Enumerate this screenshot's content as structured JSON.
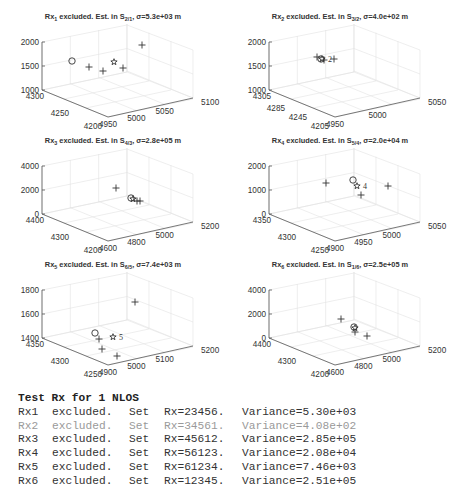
{
  "figure": {
    "panels": [
      {
        "id": "rx1",
        "title_main": "Rx",
        "title_sub": "1",
        "title_mid": " excluded. Est. in S",
        "title_sub2": "2/1",
        "title_end": ", σ=5.3e+03 m",
        "z_ticks": [
          "2000",
          "1500",
          "1000"
        ],
        "y_ticks": [
          "4300",
          "4250",
          "4200"
        ],
        "x_ticks": [
          "4950",
          "5000",
          "5050",
          "5100"
        ],
        "markers": [
          {
            "type": "circle",
            "x": 72,
            "y": 61
          },
          {
            "type": "plus",
            "x": 89,
            "y": 67
          },
          {
            "type": "plus",
            "x": 103,
            "y": 71
          },
          {
            "type": "star",
            "x": 114,
            "y": 62
          },
          {
            "type": "plus",
            "x": 123,
            "y": 68
          },
          {
            "type": "plus",
            "x": 142,
            "y": 45
          }
        ],
        "label": ""
      },
      {
        "id": "rx2",
        "title_main": "Rx",
        "title_sub": "2",
        "title_mid": " excluded. Est. in S",
        "title_sub2": "3/2",
        "title_end": ", σ=4.0e+02 m",
        "z_ticks": [
          "2000",
          "1500",
          "1000"
        ],
        "y_ticks": [
          "4305",
          "4285",
          "4245",
          "4205"
        ],
        "x_ticks": [
          "4950",
          "5000",
          "5050"
        ],
        "markers": [
          {
            "type": "plus",
            "x": 90,
            "y": 57
          },
          {
            "type": "circle",
            "x": 94,
            "y": 59
          },
          {
            "type": "star",
            "x": 95,
            "y": 59
          },
          {
            "type": "plus",
            "x": 97,
            "y": 60
          },
          {
            "type": "plus",
            "x": 107,
            "y": 59
          }
        ],
        "label": "2"
      },
      {
        "id": "rx3",
        "title_main": "Rx",
        "title_sub": "3",
        "title_mid": " excluded. Est. in S",
        "title_sub2": "4/3",
        "title_end": ", σ=2.8e+05 m",
        "z_ticks": [
          "4000",
          "2000",
          "0"
        ],
        "y_ticks": [
          "4400",
          "4300",
          "4200"
        ],
        "x_ticks": [
          "4600",
          "4800",
          "5000",
          "5200"
        ],
        "markers": [
          {
            "type": "plus",
            "x": 116,
            "y": 64
          },
          {
            "type": "circle",
            "x": 131,
            "y": 74
          },
          {
            "type": "star",
            "x": 133,
            "y": 75
          },
          {
            "type": "plus",
            "x": 137,
            "y": 77
          },
          {
            "type": "plus",
            "x": 140,
            "y": 77
          }
        ],
        "label": ""
      },
      {
        "id": "rx4",
        "title_main": "Rx",
        "title_sub": "4",
        "title_mid": " excluded. Est. in S",
        "title_sub2": "5/4",
        "title_end": ", σ=2.0e+04 m",
        "z_ticks": [
          "2000",
          "1000",
          "0"
        ],
        "y_ticks": [
          "4350",
          "4300",
          "4250"
        ],
        "x_ticks": [
          "4900",
          "4950",
          "5000",
          "5050"
        ],
        "markers": [
          {
            "type": "plus",
            "x": 99,
            "y": 59
          },
          {
            "type": "circle",
            "x": 126,
            "y": 56
          },
          {
            "type": "star",
            "x": 130,
            "y": 62
          },
          {
            "type": "plus",
            "x": 134,
            "y": 71
          },
          {
            "type": "plus",
            "x": 161,
            "y": 62
          }
        ],
        "label": "4"
      },
      {
        "id": "rx5",
        "title_main": "Rx",
        "title_sub": "5",
        "title_mid": " excluded. Est. in S",
        "title_sub2": "6/5",
        "title_end": ", σ=7.4e+03 m",
        "z_ticks": [
          "1800",
          "1600",
          "1400"
        ],
        "y_ticks": [
          "4350",
          "4300",
          "4250"
        ],
        "x_ticks": [
          "4900",
          "5000",
          "5100",
          "5200"
        ],
        "markers": [
          {
            "type": "plus",
            "x": 135,
            "y": 54
          },
          {
            "type": "circle",
            "x": 95,
            "y": 85
          },
          {
            "type": "plus",
            "x": 99,
            "y": 91
          },
          {
            "type": "star",
            "x": 113,
            "y": 89
          },
          {
            "type": "plus",
            "x": 102,
            "y": 101
          },
          {
            "type": "plus",
            "x": 117,
            "y": 108
          }
        ],
        "label": "5"
      },
      {
        "id": "rx6",
        "title_main": "Rx",
        "title_sub": "6",
        "title_mid": " excluded. Est. in S",
        "title_sub2": "1/6",
        "title_end": ", σ=2.5e+05 m",
        "z_ticks": [
          "4000",
          "2000",
          "0"
        ],
        "y_ticks": [
          "4400",
          "4300",
          "4200"
        ],
        "x_ticks": [
          "4600",
          "4800",
          "5000",
          "5200"
        ],
        "markers": [
          {
            "type": "plus",
            "x": 114,
            "y": 71
          },
          {
            "type": "circle",
            "x": 127,
            "y": 79
          },
          {
            "type": "star",
            "x": 128,
            "y": 80
          },
          {
            "type": "plus",
            "x": 128,
            "y": 84
          },
          {
            "type": "plus",
            "x": 140,
            "y": 88
          }
        ],
        "label": ""
      }
    ]
  },
  "console": {
    "header": "Test Rx for 1 NLOS",
    "rows": [
      {
        "rx": "Rx1",
        "status": "excluded.",
        "set": "Set",
        "set_value": "Rx=23456.",
        "variance": "Variance=5.30e+03",
        "dim": false
      },
      {
        "rx": "Rx2",
        "status": "excluded.",
        "set": "Set",
        "set_value": "Rx=34561.",
        "variance": "Variance=4.08e+02",
        "dim": true
      },
      {
        "rx": "Rx3",
        "status": "excluded.",
        "set": "Set",
        "set_value": "Rx=45612.",
        "variance": "Variance=2.85e+05",
        "dim": false
      },
      {
        "rx": "Rx4",
        "status": "excluded.",
        "set": "Set",
        "set_value": "Rx=56123.",
        "variance": "Variance=2.08e+04",
        "dim": false
      },
      {
        "rx": "Rx5",
        "status": "excluded.",
        "set": "Set",
        "set_value": "Rx=61234.",
        "variance": "Variance=7.46e+03",
        "dim": false
      },
      {
        "rx": "Rx6",
        "status": "excluded.",
        "set": "Set",
        "set_value": "Rx=12345.",
        "variance": "Variance=2.51e+05",
        "dim": false
      }
    ]
  },
  "chart_data": [
    {
      "type": "scatter",
      "title": "Rx1 excluded. Est. in S2/1, σ=5.3e+03 m",
      "dimensions": "3d",
      "xlim": [
        4950,
        5100
      ],
      "ylim": [
        4200,
        4300
      ],
      "zlim": [
        1000,
        2000
      ],
      "x_ticks": [
        4950,
        5000,
        5050,
        5100
      ],
      "y_ticks": [
        4200,
        4250,
        4300
      ],
      "z_ticks": [
        1000,
        1500,
        2000
      ],
      "series": [
        {
          "name": "receivers",
          "marker": "+",
          "count": 4
        },
        {
          "name": "true source",
          "marker": "o",
          "count": 1
        },
        {
          "name": "estimate",
          "marker": "pentagram",
          "count": 1
        }
      ],
      "grid": true
    },
    {
      "type": "scatter",
      "title": "Rx2 excluded. Est. in S3/2, σ=4.0e+02 m",
      "dimensions": "3d",
      "xlim": [
        4950,
        5050
      ],
      "ylim": [
        4205,
        4305
      ],
      "zlim": [
        1000,
        2000
      ],
      "x_ticks": [
        4950,
        5000,
        5050
      ],
      "y_ticks": [
        4205,
        4245,
        4285,
        4305
      ],
      "z_ticks": [
        1000,
        1500,
        2000
      ],
      "series": [
        {
          "name": "receivers",
          "marker": "+"
        },
        {
          "name": "true source",
          "marker": "o"
        },
        {
          "name": "estimate",
          "marker": "pentagram"
        }
      ],
      "annotations": [
        "2"
      ],
      "grid": true
    },
    {
      "type": "scatter",
      "title": "Rx3 excluded. Est. in S4/3, σ=2.8e+05 m",
      "dimensions": "3d",
      "xlim": [
        4600,
        5200
      ],
      "ylim": [
        4200,
        4400
      ],
      "zlim": [
        0,
        4000
      ],
      "x_ticks": [
        4600,
        4800,
        5000,
        5200
      ],
      "y_ticks": [
        4200,
        4300,
        4400
      ],
      "z_ticks": [
        0,
        2000,
        4000
      ],
      "series": [
        {
          "name": "receivers",
          "marker": "+"
        },
        {
          "name": "true source",
          "marker": "o"
        },
        {
          "name": "estimate",
          "marker": "pentagram"
        }
      ],
      "grid": true
    },
    {
      "type": "scatter",
      "title": "Rx4 excluded. Est. in S5/4, σ=2.0e+04 m",
      "dimensions": "3d",
      "xlim": [
        4900,
        5050
      ],
      "ylim": [
        4250,
        4350
      ],
      "zlim": [
        0,
        2000
      ],
      "x_ticks": [
        4900,
        4950,
        5000,
        5050
      ],
      "y_ticks": [
        4250,
        4300,
        4350
      ],
      "z_ticks": [
        0,
        1000,
        2000
      ],
      "series": [
        {
          "name": "receivers",
          "marker": "+"
        },
        {
          "name": "true source",
          "marker": "o"
        },
        {
          "name": "estimate",
          "marker": "pentagram"
        }
      ],
      "annotations": [
        "4"
      ],
      "grid": true
    },
    {
      "type": "scatter",
      "title": "Rx5 excluded. Est. in S6/5, σ=7.4e+03 m",
      "dimensions": "3d",
      "xlim": [
        4900,
        5200
      ],
      "ylim": [
        4250,
        4350
      ],
      "zlim": [
        1400,
        1800
      ],
      "x_ticks": [
        4900,
        5000,
        5100,
        5200
      ],
      "y_ticks": [
        4250,
        4300,
        4350
      ],
      "z_ticks": [
        1400,
        1600,
        1800
      ],
      "series": [
        {
          "name": "receivers",
          "marker": "+"
        },
        {
          "name": "true source",
          "marker": "o"
        },
        {
          "name": "estimate",
          "marker": "pentagram"
        }
      ],
      "annotations": [
        "5"
      ],
      "grid": true
    },
    {
      "type": "scatter",
      "title": "Rx6 excluded. Est. in S1/6, σ=2.5e+05 m",
      "dimensions": "3d",
      "xlim": [
        4600,
        5200
      ],
      "ylim": [
        4200,
        4400
      ],
      "zlim": [
        0,
        4000
      ],
      "x_ticks": [
        4600,
        4800,
        5000,
        5200
      ],
      "y_ticks": [
        4200,
        4300,
        4400
      ],
      "z_ticks": [
        0,
        2000,
        4000
      ],
      "series": [
        {
          "name": "receivers",
          "marker": "+"
        },
        {
          "name": "true source",
          "marker": "o"
        },
        {
          "name": "estimate",
          "marker": "pentagram"
        }
      ],
      "grid": true
    }
  ]
}
